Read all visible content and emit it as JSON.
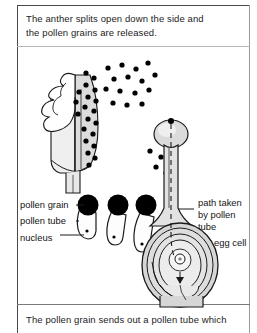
{
  "figure": {
    "title_text": "The anther splits open down the side and the pollen grains are released.",
    "caption_top": "The anther splits open down the side and\nthe pollen grains are released.",
    "caption_bottom": "The pollen grain sends out a pollen tube which",
    "diagram_type": "botany-fertilisation-diagram",
    "colors": {
      "ink": "#1a1a1a",
      "pollen_fill": "#000000",
      "organ_fill": "#d9d9d9",
      "organ_fill_light": "#eeeeee",
      "frame": "#4a4a4a",
      "background": "#ffffff"
    },
    "labels": {
      "pollen_grain": "pollen grain",
      "pollen_tube": "pollen tube",
      "nucleus": "nucleus",
      "path_taken_line1": "path taken",
      "path_taken_line2": "by pollen",
      "path_taken_line3": "tube",
      "egg_cell": "egg cell"
    },
    "structures": [
      {
        "name": "anther",
        "note": "split open down the side, releasing pollen"
      },
      {
        "name": "filament",
        "note": "stalk below the anther"
      },
      {
        "name": "stigma",
        "note": "rounded bulb at top of style where pollen lands"
      },
      {
        "name": "style",
        "note": "narrow tube containing dashed pollen-tube path"
      },
      {
        "name": "ovary",
        "note": "oval chamber with concentric integuments"
      },
      {
        "name": "ovule",
        "note": "inner oval containing the egg cell"
      },
      {
        "name": "egg-cell",
        "note": "small circle at centre of ovule"
      }
    ],
    "germinating_grains_count": 3,
    "pollen_cloud_dot_count": 44
  }
}
